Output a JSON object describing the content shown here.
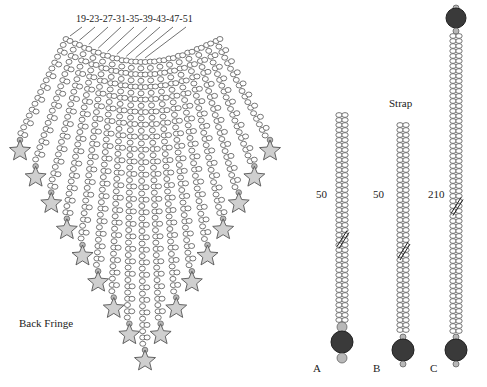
{
  "fringe": {
    "title": "Back Fringe",
    "strand_labels": "19-23-27-31-35-39-43-47-51",
    "strand_counts": [
      19,
      23,
      27,
      31,
      35,
      39,
      43,
      47,
      51
    ],
    "strand_total": 17,
    "ending": "star"
  },
  "strap": {
    "title": "Strap",
    "variants": [
      {
        "id": "A",
        "count": "50"
      },
      {
        "id": "B",
        "count": "50"
      },
      {
        "id": "C",
        "count": "210"
      }
    ]
  },
  "colors": {
    "bead_stroke": "#555555",
    "star_fill": "#cfcfcf",
    "accent_bead": "#b8b8b8",
    "medallion": "#3a3a3a"
  }
}
